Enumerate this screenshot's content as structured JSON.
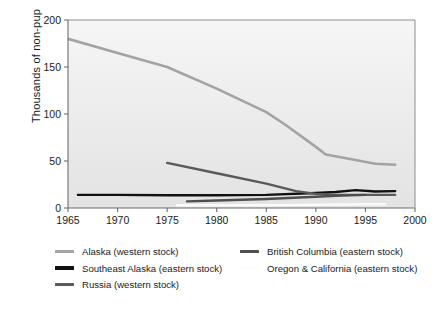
{
  "chart_data": {
    "type": "line",
    "title": "",
    "subtitle": "",
    "xlabel": "",
    "ylabel": "Thousands of non-pup",
    "xlim": [
      1965,
      2000
    ],
    "ylim": [
      0,
      200
    ],
    "xticks": [
      1965,
      1970,
      1975,
      1980,
      1985,
      1990,
      1995,
      2000
    ],
    "xtick_labels": [
      "1965",
      "1970",
      "1975",
      "1980",
      "1985",
      "1990",
      "1995",
      "2000"
    ],
    "yticks": [
      0,
      50,
      100,
      150,
      200
    ],
    "ytick_labels": [
      "0",
      "50",
      "100",
      "150",
      "200"
    ],
    "grid": false,
    "legend_position": "below-plot-two-columns",
    "plot_background": "#ececed",
    "axis_color": "#6d6e70",
    "series": [
      {
        "name": "Alaska (western stock)",
        "color": "#a3a3a3",
        "width": 2.6,
        "x": [
          1965,
          1970,
          1975,
          1980,
          1985,
          1987,
          1990,
          1991,
          1994,
          1996,
          1998
        ],
        "values": [
          180,
          165,
          150,
          127,
          102,
          88,
          65,
          57,
          51,
          47,
          46
        ]
      },
      {
        "name": "Southeast Alaska (eastern stock)",
        "color": "#111111",
        "width": 2.4,
        "x": [
          1966,
          1970,
          1975,
          1980,
          1985,
          1990,
          1992,
          1994,
          1996,
          1998
        ],
        "values": [
          14,
          14,
          13.5,
          13.5,
          14,
          16,
          17,
          19,
          17.5,
          18
        ]
      },
      {
        "name": "Russia (western stock)",
        "color": "#5a5a5a",
        "width": 2.4,
        "x": [
          1975,
          1980,
          1985,
          1988,
          1990,
          1992,
          1995,
          1998
        ],
        "values": [
          48,
          37,
          26,
          18,
          15,
          14,
          14,
          14
        ]
      },
      {
        "name": "British Columbia (eastern stock)",
        "color": "#4f4f4f",
        "width": 2.4,
        "x": [
          1977,
          1980,
          1985,
          1990,
          1992,
          1995
        ],
        "values": [
          7,
          8,
          9.5,
          12,
          13,
          14
        ]
      },
      {
        "name": "Oregon & California (eastern stock)",
        "color": "#fbfbfb",
        "width": 2.6,
        "x": [
          1976,
          1980,
          1985,
          1990,
          1995,
          1997
        ],
        "values": [
          3,
          3,
          3,
          3.5,
          4,
          4
        ]
      }
    ]
  },
  "legend": {
    "columns": [
      {
        "items": [
          {
            "label": "Alaska (western stock)",
            "color": "#a3a3a3"
          },
          {
            "label": "Southeast Alaska (eastern stock)",
            "color": "#111111"
          },
          {
            "label": "Russia (western stock)",
            "color": "#5a5a5a"
          }
        ]
      },
      {
        "items": [
          {
            "label": "British Columbia (eastern stock)",
            "color": "#4f4f4f"
          },
          {
            "label": "Oregon & California (eastern stock)",
            "color": "#fdfdfd"
          }
        ]
      }
    ]
  }
}
